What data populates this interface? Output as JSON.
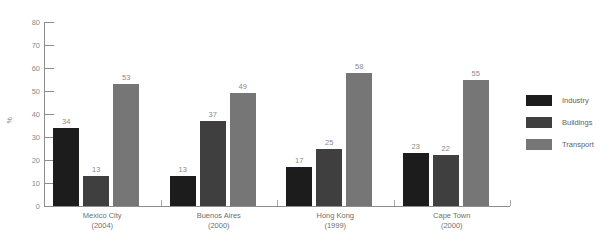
{
  "chart_data": {
    "type": "bar",
    "title": "FIGURE 4.1: ENERGY CONSUMPTION IN SELECTED CITIES IN MIDDLE INCOME COUNTRIES",
    "xlabel": "",
    "ylabel": "%",
    "ylim": [
      0,
      80
    ],
    "yticks": [
      0,
      10,
      20,
      30,
      40,
      50,
      60,
      70,
      80
    ],
    "grid": false,
    "legend_position": "right",
    "categories": [
      "Mexico City",
      "Buenos Aires",
      "Hong Kong",
      "Cape Town"
    ],
    "category_years": [
      "(2004)",
      "(2000)",
      "(1999)",
      "(2000)"
    ],
    "series": [
      {
        "name": "Industry",
        "color": "#1c1c1c",
        "values": [
          34,
          13,
          17,
          23
        ]
      },
      {
        "name": "Buildings",
        "color": "#3f3f3f",
        "values": [
          13,
          37,
          25,
          22
        ]
      },
      {
        "name": "Transport",
        "color": "#767676",
        "values": [
          53,
          49,
          58,
          55
        ]
      }
    ]
  }
}
